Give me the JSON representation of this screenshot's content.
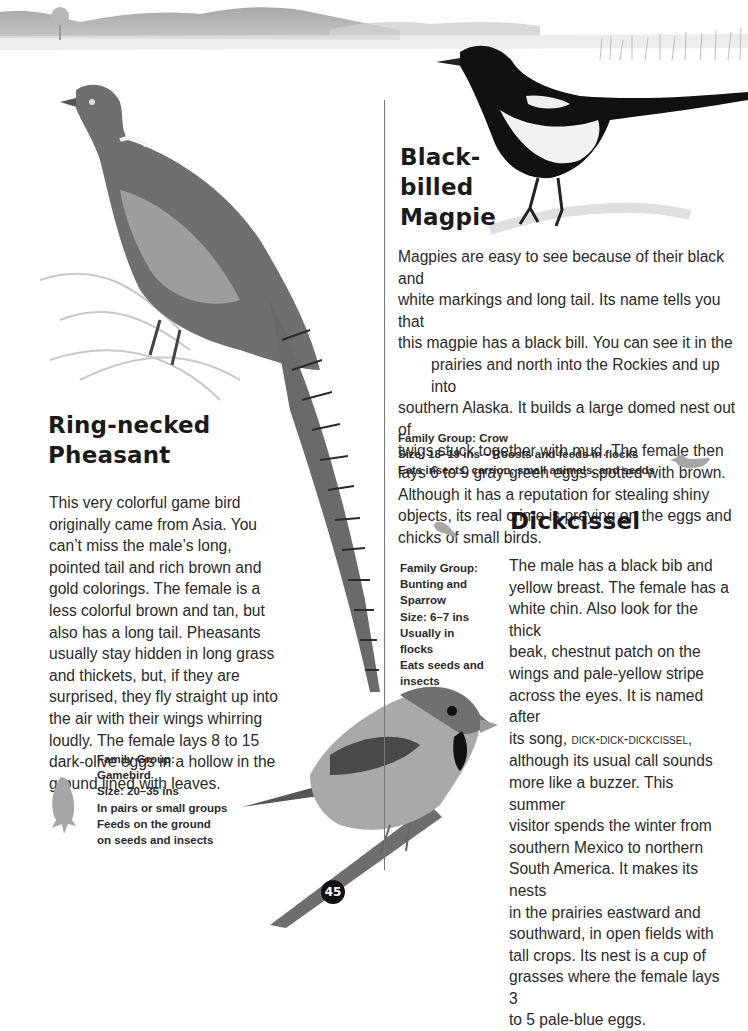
{
  "page": {
    "number": "45"
  },
  "magpie": {
    "title_lines": [
      "Black-",
      "billed",
      "Magpie"
    ],
    "paragraph_lines": [
      "Magpies are easy to see because of their black and",
      "white markings and long tail. Its name tells you that",
      "this magpie has a black bill. You can see it in the",
      "prairies and north into the Rockies and up into",
      "southern Alaska. It builds a large domed nest out of",
      "twigs stuck together with mud. The female then",
      "lays 6 to 9 gray-green eggs spotted with brown.",
      "Although it has a reputation for stealing shiny",
      "objects, its real crime is preying on the eggs and",
      "chicks of small birds."
    ],
    "facts": [
      "Family Group: Crow",
      "Size: 18–19 ins – Roosts and feeds in flocks",
      "Eats insects, carrion, small animals, and seeds"
    ],
    "size_icon": "duck-silhouette-icon"
  },
  "pheasant": {
    "title_lines": [
      "Ring-necked",
      "Pheasant"
    ],
    "paragraph_lines": [
      "This very colorful game bird",
      "originally came from Asia. You",
      "can’t miss the male’s long,",
      "pointed tail and rich brown and",
      "gold colorings. The female is a",
      "less colorful brown and tan, but",
      "also has a long tail. Pheasants",
      "usually stay hidden in long grass",
      "and thickets, but, if they are",
      "surprised, they fly straight up into",
      "the air with their wings whirring",
      "loudly. The female lays 8 to 15",
      "dark-olive eggs in a hollow in the",
      "ground lined with leaves."
    ],
    "facts": [
      "Family Group:",
      "Gamebird",
      "Size: 20–35 ins",
      "In pairs or small groups",
      "Feeds on the ground",
      "on seeds and insects"
    ],
    "size_icon": "hawk-silhouette-icon"
  },
  "dickcissel": {
    "title": "Dickcissel",
    "paragraph_lines": [
      "The male has a black bib and",
      "yellow breast. The female has a",
      "white chin. Also look for the thick",
      "beak, chestnut patch on the",
      "wings and pale-yellow stripe",
      "across the eyes. It is named after",
      "its song, ",
      "although its usual call sounds",
      "more like a buzzer. This summer",
      "visitor spends the winter from",
      "southern Mexico to northern",
      "South America. It makes its nests",
      "in the prairies eastward and",
      "southward, in open fields with",
      "tall crops. Its nest is a cup of",
      "grasses where the female lays 3",
      "to 5 pale-blue eggs."
    ],
    "song": "dick-dick-dickcissel,",
    "facts": [
      "Family Group:",
      "Bunting and",
      "Sparrow",
      "Size: 6–7 ins",
      "Usually in flocks",
      "Eats seeds and",
      "insects"
    ],
    "size_icon": "sparrow-silhouette-icon"
  },
  "colors": {
    "text": "#2a2a2a",
    "heading": "#1a1a1a",
    "silhouette": "#a6a6a6",
    "divider": "#777777"
  }
}
